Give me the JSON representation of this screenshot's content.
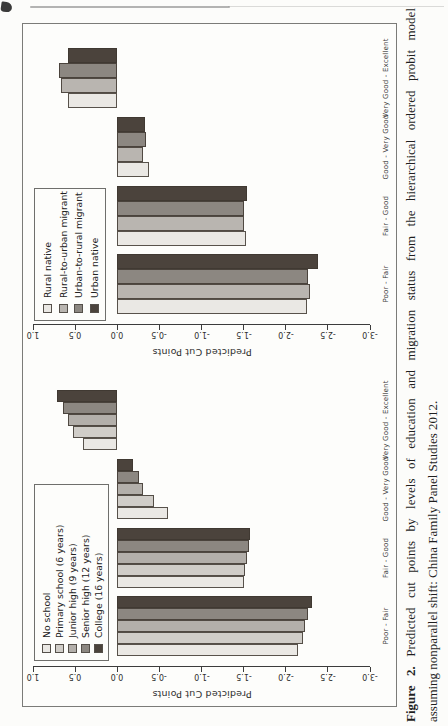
{
  "caption": {
    "label": "Figure 2.",
    "line1_rest": "Predicted cut points by levels of education and migration status from the hierarchical ordered probit model",
    "line2": "assuming nonparallel shift: China Family Panel Studies 2012."
  },
  "chart_data": [
    {
      "type": "bar",
      "name": "education",
      "title": "",
      "xlabel": "",
      "ylabel": "Predicted Cut Points",
      "ylim": [
        -3.0,
        1.0
      ],
      "yticks": [
        "1.0",
        "0.5",
        "0.0",
        "-0.5",
        "-1.0",
        "-1.5",
        "-2.0",
        "-2.5",
        "-3.0"
      ],
      "grid": false,
      "legend_position": "top-left",
      "categories": [
        "Poor - Fair",
        "Fair - Good",
        "Good - Very Good",
        "Very Good - Excellent"
      ],
      "series": [
        {
          "name": "No school",
          "color": "#eae8e4",
          "values": [
            -2.15,
            -1.5,
            -0.6,
            0.41
          ]
        },
        {
          "name": "Primary school (6 years)",
          "color": "#d0cdc8",
          "values": [
            -2.2,
            -1.52,
            -0.44,
            0.53
          ]
        },
        {
          "name": "Junior high (9 years)",
          "color": "#b3afaa",
          "values": [
            -2.23,
            -1.54,
            -0.3,
            0.59
          ]
        },
        {
          "name": "Senior high (12 years)",
          "color": "#8c8781",
          "values": [
            -2.27,
            -1.56,
            -0.26,
            0.64
          ]
        },
        {
          "name": "College (16 years)",
          "color": "#4b433c",
          "values": [
            -2.31,
            -1.58,
            -0.19,
            0.72
          ]
        }
      ]
    },
    {
      "type": "bar",
      "name": "migration",
      "title": "",
      "xlabel": "",
      "ylabel": "Predicted Cut Points",
      "ylim": [
        -3.0,
        1.0
      ],
      "yticks": [
        "1.0",
        "0.5",
        "0.0",
        "-0.5",
        "-1.0",
        "-1.5",
        "-2.0",
        "-2.5",
        "-3.0"
      ],
      "grid": false,
      "legend_position": "top-left",
      "categories": [
        "Poor - Fair",
        "Fair - Good",
        "Good - Very Good",
        "Very Good - Excellent"
      ],
      "series": [
        {
          "name": "Rural native",
          "color": "#eae8e4",
          "values": [
            -2.25,
            -1.53,
            -0.38,
            0.58
          ]
        },
        {
          "name": "Rural-to-urban migrant",
          "color": "#b9b5b0",
          "values": [
            -2.29,
            -1.5,
            -0.31,
            0.67
          ]
        },
        {
          "name": "Urban-to-rural migrant",
          "color": "#8c8781",
          "values": [
            -2.26,
            -1.5,
            -0.34,
            0.69
          ]
        },
        {
          "name": "Urban native",
          "color": "#4b433c",
          "values": [
            -2.38,
            -1.54,
            -0.33,
            0.58
          ]
        }
      ]
    }
  ]
}
